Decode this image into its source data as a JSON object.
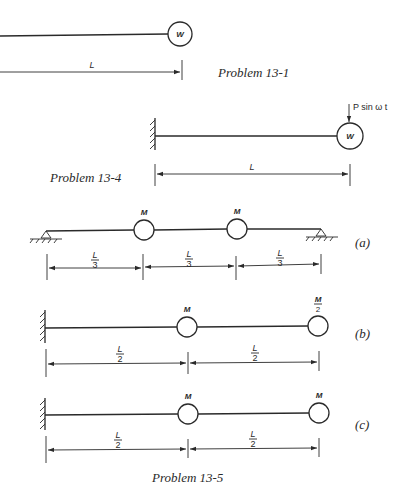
{
  "figure": {
    "problem_13_1": {
      "caption": "Problem 13-1",
      "mass_label": "W",
      "dimension_label": "L"
    },
    "problem_13_4": {
      "caption": "Problem 13-4",
      "mass_label": "W",
      "force_label": "P sin ω t",
      "dimension_label": "L"
    },
    "problem_13_5": {
      "caption": "Problem 13-5",
      "parts": [
        {
          "tag": "(a)",
          "support": "simply supported (pinned both ends)",
          "masses": [
            "M",
            "M"
          ],
          "dimensions": [
            {
              "num": "L",
              "den": "3"
            },
            {
              "num": "L",
              "den": "3"
            },
            {
              "num": "L",
              "den": "3"
            }
          ]
        },
        {
          "tag": "(b)",
          "support": "cantilever (fixed left end)",
          "masses": [
            {
              "num": "M",
              "den": ""
            },
            {
              "num": "M",
              "den": "2"
            }
          ],
          "dimensions": [
            {
              "num": "L",
              "den": "2"
            },
            {
              "num": "L",
              "den": "2"
            }
          ]
        },
        {
          "tag": "(c)",
          "support": "cantilever (fixed left end)",
          "masses": [
            "M",
            "M"
          ],
          "dimensions": [
            {
              "num": "L",
              "den": "2"
            },
            {
              "num": "L",
              "den": "2"
            }
          ]
        }
      ]
    }
  }
}
